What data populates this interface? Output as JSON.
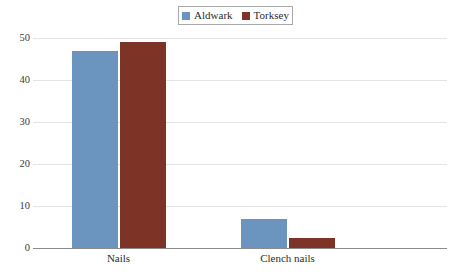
{
  "chart_data": {
    "type": "bar",
    "title": "",
    "subtitle": "",
    "xlabel": "",
    "ylabel": "",
    "categories": [
      "Nails",
      "Clench nails"
    ],
    "series": [
      {
        "name": "Aldwark",
        "color": "#6B94BE",
        "values": [
          47,
          7
        ]
      },
      {
        "name": "Torksey",
        "color": "#7E3327",
        "values": [
          49,
          2.5
        ]
      }
    ],
    "ylim": [
      0,
      50
    ],
    "ytick_labels": [
      "50",
      "40",
      "30",
      "20",
      "10",
      "0"
    ],
    "ytick_values": [
      50,
      40,
      30,
      20,
      10,
      0
    ],
    "grid": true,
    "legend_position": "top-center"
  },
  "legend": {
    "entries": [
      {
        "label": "Aldwark",
        "color": "#6B94BE"
      },
      {
        "label": "Torksey",
        "color": "#7E3327"
      }
    ]
  },
  "axes": {
    "y_ticks": [
      "50",
      "40",
      "30",
      "20",
      "10",
      "0"
    ],
    "x_ticks": [
      "Nails",
      "Clench nails"
    ]
  }
}
